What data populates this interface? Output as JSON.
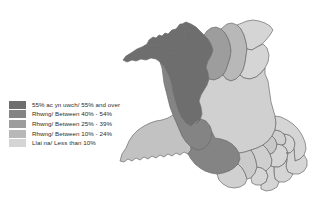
{
  "figure": {
    "title_fragment": "",
    "background_color": "#ffffff"
  },
  "legend": {
    "name": "map-legend",
    "classes": [
      {
        "label": "55% ac yn uwch/ 55% and over",
        "color": "#6e6e6e",
        "min": 55,
        "max": 100
      },
      {
        "label": "Rhwng/ Between 40% - 54%",
        "color": "#848484",
        "min": 40,
        "max": 54
      },
      {
        "label": "Rhwng/ Between 25% - 39%",
        "color": "#9d9d9d",
        "min": 25,
        "max": 39
      },
      {
        "label": "Rhwng/ Between 10% - 24%",
        "color": "#b8b8b8",
        "min": 10,
        "max": 24
      },
      {
        "label": "Llai na/ Less than 10%",
        "color": "#d5d5d5",
        "min": 0,
        "max": 9
      }
    ]
  },
  "map": {
    "name": "wales-choropleth",
    "region": "Wales",
    "outline_color": "#6b6b6b",
    "areas": [
      {
        "name": "Isle of Anglesey",
        "class_index": 0,
        "color": "#6e6e6e"
      },
      {
        "name": "Gwynedd",
        "class_index": 0,
        "color": "#6e6e6e"
      },
      {
        "name": "Conwy",
        "class_index": 2,
        "color": "#9d9d9d"
      },
      {
        "name": "Denbighshire",
        "class_index": 3,
        "color": "#b8b8b8"
      },
      {
        "name": "Flintshire",
        "class_index": 4,
        "color": "#d5d5d5"
      },
      {
        "name": "Wrexham",
        "class_index": 4,
        "color": "#d5d5d5"
      },
      {
        "name": "Ceredigion",
        "class_index": 1,
        "color": "#848484"
      },
      {
        "name": "Powys",
        "class_index": 4,
        "color": "#d0d0d0"
      },
      {
        "name": "Pembrokeshire",
        "class_index": 3,
        "color": "#c2c2c2"
      },
      {
        "name": "Carmarthenshire",
        "class_index": 1,
        "color": "#848484"
      },
      {
        "name": "Swansea",
        "class_index": 4,
        "color": "#d0d0d0"
      },
      {
        "name": "Neath Port Talbot",
        "class_index": 4,
        "color": "#cacaca"
      },
      {
        "name": "Bridgend",
        "class_index": 4,
        "color": "#d5d5d5"
      },
      {
        "name": "Rhondda Cynon Taf",
        "class_index": 4,
        "color": "#cfcfcf"
      },
      {
        "name": "Merthyr Tydfil",
        "class_index": 4,
        "color": "#c8c8c8"
      },
      {
        "name": "Caerphilly",
        "class_index": 4,
        "color": "#d5d5d5"
      },
      {
        "name": "Blaenau Gwent",
        "class_index": 4,
        "color": "#cfcfcf"
      },
      {
        "name": "Torfaen",
        "class_index": 4,
        "color": "#d5d5d5"
      },
      {
        "name": "Monmouthshire",
        "class_index": 4,
        "color": "#d5d5d5"
      },
      {
        "name": "Newport",
        "class_index": 4,
        "color": "#d5d5d5"
      },
      {
        "name": "Cardiff",
        "class_index": 4,
        "color": "#d5d5d5"
      },
      {
        "name": "Vale of Glamorgan",
        "class_index": 4,
        "color": "#d5d5d5"
      }
    ]
  }
}
